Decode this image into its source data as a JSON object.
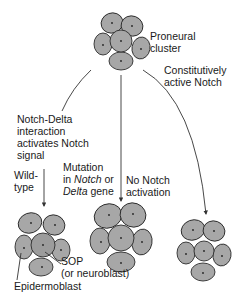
{
  "diagram": {
    "type": "flow",
    "colors": {
      "cell_fill": "#a7a7a7",
      "cell_stroke": "#2c2c2c",
      "line": "#333333",
      "text": "#1a1a1a"
    },
    "nodes": {
      "top_cluster": {
        "label_line1": "Proneural",
        "label_line2": "cluster"
      },
      "wild_type_cluster": {
        "sop_label_line1": "SOP",
        "sop_label_line2": "(or neuroblast)",
        "epidermoblast_label": "Epidermoblast"
      },
      "mutation_cluster": {},
      "constitutive_cluster": {}
    },
    "edges": {
      "left": {
        "label_line1": "Notch-Delta",
        "label_line2": "interaction",
        "label_line3": "activates Notch",
        "label_line4": "signal",
        "sub_label_line1": "Wild-",
        "sub_label_line2": "type"
      },
      "middle": {
        "label_line1": "Mutation",
        "label_line2_pre": "in ",
        "label_line2_italic": "Notch",
        "label_line2_post": " or",
        "label_line3_italic": "Delta",
        "label_line3_post": " gene",
        "effect_line1": "No Notch",
        "effect_line2": "activation"
      },
      "right": {
        "label_line1": "Constitutively",
        "label_line2": "active Notch"
      }
    }
  }
}
